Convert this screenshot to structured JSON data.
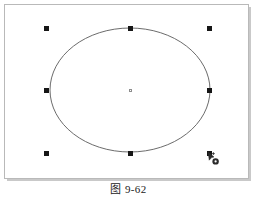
{
  "figure": {
    "caption": "图 9-62",
    "canvas_background": "#ffffff",
    "frame_outer_color": "#b9b9b9",
    "frame_inner_color": "#9a9a9a"
  },
  "drawing": {
    "shape": {
      "type": "ellipse",
      "name": "selected-ellipse",
      "stroke_color": "#5a5a5a",
      "fill": "none",
      "cx": 122,
      "cy": 82,
      "rx": 80,
      "ry": 62
    },
    "selection": {
      "grip_color": "#161616",
      "grip_size": 5,
      "center_grip_color": "#ffffff",
      "center_grip_border": "#8d8d8d",
      "grips": [
        {
          "name": "grip-top-left",
          "x": 36,
          "y": 18,
          "label": "top-left"
        },
        {
          "name": "grip-top-center",
          "x": 120,
          "y": 18,
          "label": "top-center"
        },
        {
          "name": "grip-top-right",
          "x": 199,
          "y": 18,
          "label": "top-right"
        },
        {
          "name": "grip-middle-left",
          "x": 36,
          "y": 80,
          "label": "middle-left"
        },
        {
          "name": "grip-middle-right",
          "x": 199,
          "y": 80,
          "label": "middle-right"
        },
        {
          "name": "grip-bottom-left",
          "x": 36,
          "y": 143,
          "label": "bottom-left"
        },
        {
          "name": "grip-bottom-center",
          "x": 120,
          "y": 143,
          "label": "bottom-center"
        },
        {
          "name": "grip-bottom-right",
          "x": 199,
          "y": 143,
          "label": "bottom-right"
        }
      ],
      "center_grip": {
        "name": "grip-center",
        "x": 121,
        "y": 81,
        "label": "center"
      }
    },
    "cursor": {
      "name": "mouse-pointer-cursor",
      "x": 199,
      "y": 143,
      "color": "#2a2a2a"
    }
  }
}
